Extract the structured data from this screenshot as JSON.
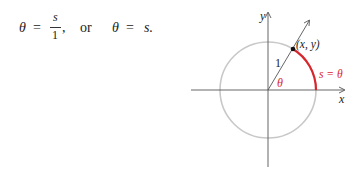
{
  "equation": {
    "theta": "θ",
    "equals": "=",
    "numerator": "s",
    "denominator": "1",
    "comma": ",",
    "connector": "or",
    "theta2": "θ",
    "equals2": "=",
    "rhs": "s."
  },
  "figure": {
    "y_axis_label": "y",
    "x_axis_label": "x",
    "point_label": "(x, y)",
    "radius_label": "1",
    "angle_label": "θ",
    "arc_label": "s = θ",
    "colors": {
      "axis": "#555555",
      "circle": "#c8c8c8",
      "arc": "#d9262c",
      "angle_label": "#d9262c",
      "arc_label": "#d9262c",
      "text": "#222222"
    }
  }
}
